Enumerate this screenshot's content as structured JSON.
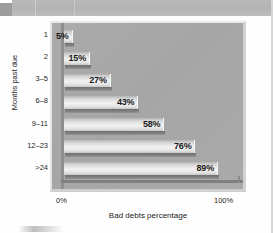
{
  "chart_data": {
    "type": "bar",
    "orientation": "horizontal",
    "title": "",
    "xlabel": "Bad debts percentage",
    "ylabel": "Months past due",
    "categories": [
      "1",
      "2",
      "3–5",
      "6–8",
      "9–11",
      "12–23",
      ">24"
    ],
    "values": [
      5,
      15,
      27,
      43,
      58,
      76,
      89
    ],
    "value_labels": [
      "5%",
      "15%",
      "27%",
      "43%",
      "58%",
      "76%",
      "89%"
    ],
    "xlim": [
      0,
      100
    ],
    "xticks": [
      "0%",
      "100%"
    ],
    "grid": false,
    "legend": null,
    "bar_color": "#ededed",
    "plot_background": "#a9a9a9"
  }
}
